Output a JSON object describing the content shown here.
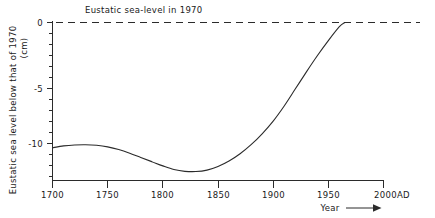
{
  "chart_data": {
    "type": "line",
    "title": "",
    "xlabel": "Year",
    "ylabel": "Eustatic sea level below that of 1970 (cm)",
    "xlim": [
      1700,
      2000
    ],
    "ylim": [
      -13.8,
      0.8
    ],
    "grid": false,
    "legend": null,
    "x_tick_labels": [
      "1700",
      "1750",
      "1800",
      "1850",
      "1900",
      "1950",
      "2000AD"
    ],
    "x_ticks": [
      1700,
      1750,
      1800,
      1850,
      1900,
      1950,
      2000
    ],
    "y_tick_labels": [
      "0",
      "-5",
      "-10"
    ],
    "y_ticks": [
      0,
      -5,
      -10
    ],
    "y_minor_ticks": [
      -1,
      -2,
      -3,
      -4,
      -6,
      -7,
      -8,
      -9,
      -11,
      -12,
      -13
    ],
    "annotations": [
      {
        "name": "eustatic-reference-label",
        "text": "Eustatic sea-level in 1970",
        "x": 1745,
        "y": 0
      },
      {
        "name": "year-axis-arrow-label",
        "text": "Year",
        "x": 1935,
        "y": -15.2
      }
    ],
    "reference_line": {
      "name": "eustatic-sea-level-1970",
      "value": 0,
      "style": "dashed",
      "label": "Eustatic sea-level in 1970"
    },
    "series": [
      {
        "name": "eustatic-sea-level-curve",
        "x": [
          1700,
          1710,
          1720,
          1730,
          1740,
          1750,
          1760,
          1770,
          1780,
          1790,
          1800,
          1810,
          1820,
          1830,
          1840,
          1850,
          1860,
          1870,
          1880,
          1890,
          1900,
          1910,
          1920,
          1930,
          1940,
          1950,
          1960,
          1965
        ],
        "values": [
          -10.35,
          -10.2,
          -10.12,
          -10.1,
          -10.15,
          -10.28,
          -10.5,
          -10.8,
          -11.15,
          -11.5,
          -11.85,
          -12.15,
          -12.3,
          -12.32,
          -12.2,
          -11.9,
          -11.45,
          -10.85,
          -10.1,
          -9.2,
          -8.15,
          -6.9,
          -5.5,
          -4.1,
          -2.75,
          -1.5,
          -0.35,
          0.0
        ]
      }
    ]
  },
  "axis_titles": {
    "y": "Eustatic sea level below that of 1970",
    "y_units": "(cm)",
    "x": "Year"
  },
  "colors": {
    "ink": "#2b2b2b",
    "background": "#ffffff"
  }
}
